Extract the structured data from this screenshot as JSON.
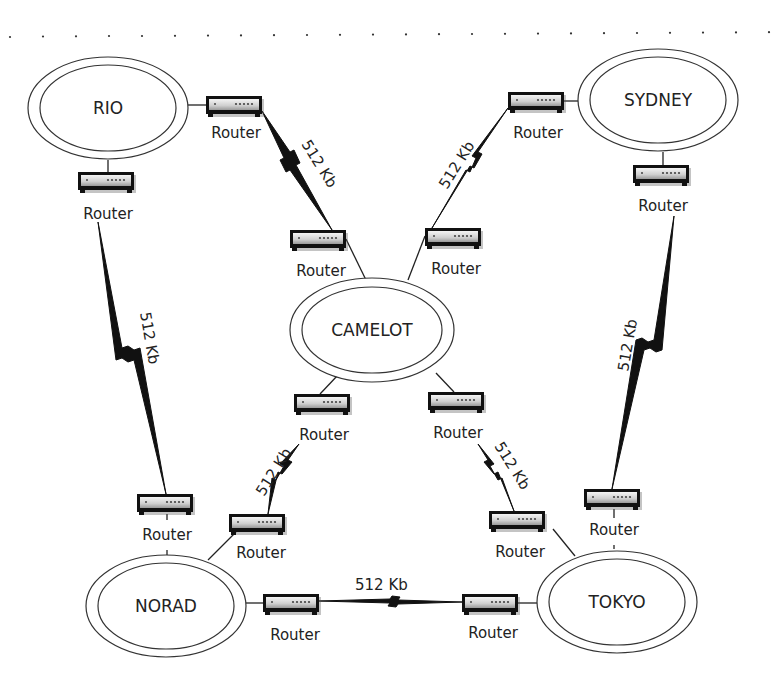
{
  "diagram": {
    "type": "wan-network-topology",
    "colors": {
      "line": "#222222",
      "router_body": "#e0e0e0",
      "router_frame": "#111111",
      "dots": "#333333"
    },
    "sites": [
      {
        "id": "rio",
        "label": "RIO",
        "cx": 108,
        "cy": 108
      },
      {
        "id": "sydney",
        "label": "SYDNEY",
        "cx": 658,
        "cy": 100
      },
      {
        "id": "camelot",
        "label": "CAMELOT",
        "cx": 372,
        "cy": 330
      },
      {
        "id": "norad",
        "label": "NORAD",
        "cx": 166,
        "cy": 606
      },
      {
        "id": "tokyo",
        "label": "TOKYO",
        "cx": 617,
        "cy": 602
      }
    ],
    "router_label": "Router",
    "routers": [
      {
        "id": "r1",
        "site": "rio",
        "x": 206,
        "y": 96,
        "label": "Router",
        "lx": 236,
        "ly": 138
      },
      {
        "id": "r2",
        "site": "rio",
        "x": 78,
        "y": 172,
        "label": "Router",
        "lx": 108,
        "ly": 219
      },
      {
        "id": "r3",
        "site": "camelot",
        "x": 290,
        "y": 230,
        "label": "Router",
        "lx": 321,
        "ly": 276
      },
      {
        "id": "r4",
        "site": "camelot",
        "x": 425,
        "y": 228,
        "label": "Router",
        "lx": 456,
        "ly": 274
      },
      {
        "id": "r5",
        "site": "sydney",
        "x": 508,
        "y": 92,
        "label": "Router",
        "lx": 538,
        "ly": 138
      },
      {
        "id": "r6",
        "site": "sydney",
        "x": 633,
        "y": 165,
        "label": "Router",
        "lx": 663,
        "ly": 211
      },
      {
        "id": "r7",
        "site": "camelot",
        "x": 294,
        "y": 394,
        "label": "Router",
        "lx": 324,
        "ly": 440
      },
      {
        "id": "r8",
        "site": "camelot",
        "x": 428,
        "y": 392,
        "label": "Router",
        "lx": 458,
        "ly": 438
      },
      {
        "id": "r9",
        "site": "norad",
        "x": 137,
        "y": 494,
        "label": "Router",
        "lx": 167,
        "ly": 540
      },
      {
        "id": "r10",
        "site": "norad",
        "x": 229,
        "y": 514,
        "label": "Router",
        "lx": 261,
        "ly": 558
      },
      {
        "id": "r11",
        "site": "tokyo",
        "x": 584,
        "y": 489,
        "label": "Router",
        "lx": 614,
        "ly": 535
      },
      {
        "id": "r12",
        "site": "tokyo",
        "x": 489,
        "y": 511,
        "label": "Router",
        "lx": 520,
        "ly": 557
      },
      {
        "id": "r13",
        "site": "norad",
        "x": 263,
        "y": 594,
        "label": "Router",
        "lx": 295,
        "ly": 640
      },
      {
        "id": "r14",
        "site": "tokyo",
        "x": 462,
        "y": 594,
        "label": "Router",
        "lx": 493,
        "ly": 638
      }
    ],
    "links": [
      {
        "id": "rio-camelot",
        "from": "r1",
        "to": "r3",
        "speed": "512 Kb"
      },
      {
        "id": "sydney-camelot",
        "from": "r5",
        "to": "r4",
        "speed": "512 Kb"
      },
      {
        "id": "rio-norad",
        "from": "r2",
        "to": "r9",
        "speed": "512 Kb"
      },
      {
        "id": "sydney-tokyo",
        "from": "r6",
        "to": "r11",
        "speed": "512 Kb"
      },
      {
        "id": "camelot-norad",
        "from": "r7",
        "to": "r10",
        "speed": "512 Kb"
      },
      {
        "id": "camelot-tokyo",
        "from": "r8",
        "to": "r12",
        "speed": "512 Kb"
      },
      {
        "id": "norad-tokyo",
        "from": "r13",
        "to": "r14",
        "speed": "512 Kb"
      }
    ]
  }
}
